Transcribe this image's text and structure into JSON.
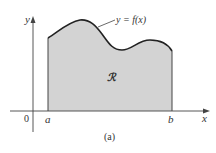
{
  "figure": {
    "caption": "(a)",
    "curve_label": "y = f(x)",
    "region_label": "ℛ",
    "axis_labels": {
      "x": "x",
      "y": "y",
      "origin": "0"
    },
    "interval": {
      "left": "a",
      "right": "b"
    },
    "colors": {
      "region_fill": "#d3d3d3",
      "curve": "#222222",
      "axes": "#444444"
    }
  }
}
